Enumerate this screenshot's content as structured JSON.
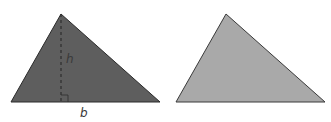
{
  "diagram": {
    "background": "#ffffff",
    "left_triangle": {
      "points": "61,14 11,102 160,102",
      "fill": "#5e5e5e",
      "stroke": "#2a2a2a",
      "height_line": {
        "x1": 61,
        "y1": 14,
        "x2": 61,
        "y2": 102,
        "color": "#2e2e2e"
      },
      "right_angle_mark": "61,95 68,95 68,102",
      "height_label": {
        "text": "h",
        "x": 66,
        "y": 63
      },
      "base_label": {
        "text": "b",
        "x": 80,
        "y": 117
      },
      "label_color": "#3a3a3a"
    },
    "right_triangle": {
      "points": "226,14 176,102 325,102",
      "fill": "#a9a9a9",
      "stroke": "#3a3a3a"
    }
  }
}
